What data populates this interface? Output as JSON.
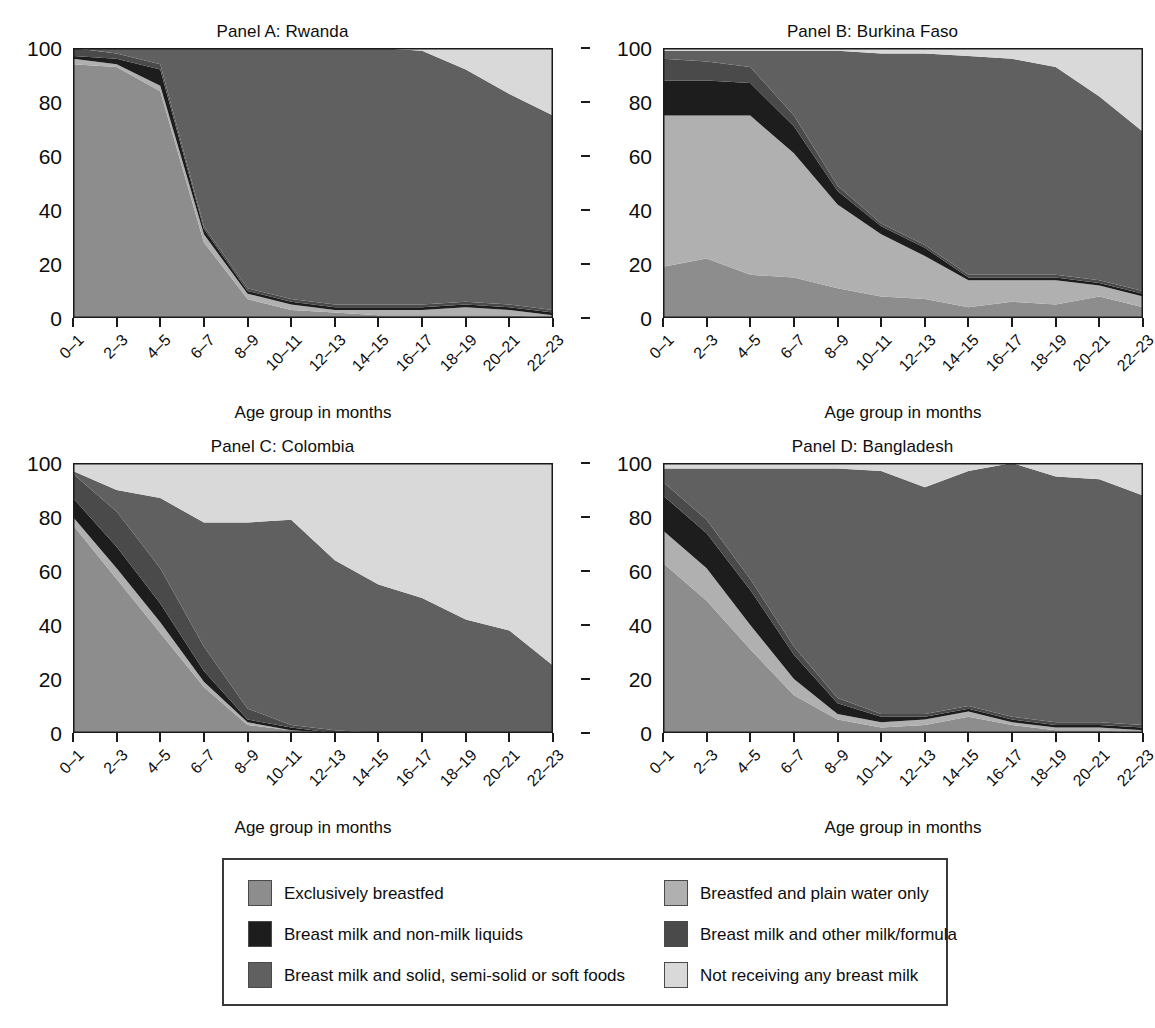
{
  "figure": {
    "xlabel": "Age group in months",
    "categories": [
      "0–1",
      "2–3",
      "4–5",
      "6–7",
      "8–9",
      "10–11",
      "12–13",
      "14–15",
      "16–17",
      "18–19",
      "20–21",
      "22–23"
    ],
    "yticks": [
      "0",
      "20",
      "40",
      "60",
      "80",
      "100"
    ],
    "ylim": [
      0,
      100
    ]
  },
  "colors": {
    "exclusively_breastfed": "#8d8d8d",
    "plain_water_only": "#b0b0b0",
    "non_milk_liquids": "#1d1d1d",
    "other_milk_formula": "#4a4a4a",
    "solid_foods": "#606060",
    "not_receiving": "#d9d9d9",
    "axis": "#1a1a1a",
    "legend_border": "#3a3a3a"
  },
  "legend": {
    "items": [
      {
        "key": "exclusively_breastfed",
        "label": "Exclusively breastfed",
        "color": "#8d8d8d",
        "col": 0,
        "row": 0
      },
      {
        "key": "plain_water_only",
        "label": "Breastfed and plain water only",
        "color": "#b0b0b0",
        "col": 1,
        "row": 0
      },
      {
        "key": "non_milk_liquids",
        "label": "Breast milk and non-milk liquids",
        "color": "#1d1d1d",
        "col": 0,
        "row": 1
      },
      {
        "key": "other_milk_formula",
        "label": "Breast milk and other milk/formula",
        "color": "#4a4a4a",
        "col": 1,
        "row": 1
      },
      {
        "key": "solid_foods",
        "label": "Breast milk and solid, semi-solid or soft foods",
        "color": "#606060",
        "col": 0,
        "row": 2
      },
      {
        "key": "not_receiving",
        "label": "Not receiving any breast milk",
        "color": "#d9d9d9",
        "col": 1,
        "row": 2
      }
    ]
  },
  "chart_data": [
    {
      "type": "area",
      "id": "panel-a",
      "title": "Panel A: Rwanda",
      "xlabel": "Age group in months",
      "ylabel": "",
      "ylim": [
        0,
        100
      ],
      "stacked": true,
      "grid": false,
      "legend_position": "bottom",
      "categories": [
        "0–1",
        "2–3",
        "4–5",
        "6–7",
        "8–9",
        "10–11",
        "12–13",
        "14–15",
        "16–17",
        "18–19",
        "20–21",
        "22–23"
      ],
      "series": [
        {
          "name": "Exclusively breastfed",
          "color": "#8d8d8d",
          "values": [
            94,
            93,
            84,
            28,
            7,
            3,
            2,
            1,
            1,
            1,
            1,
            0
          ]
        },
        {
          "name": "Breastfed and plain water only",
          "color": "#b0b0b0",
          "values": [
            2,
            1,
            2,
            3,
            2,
            2,
            1,
            2,
            2,
            3,
            2,
            1
          ]
        },
        {
          "name": "Breast milk and non-milk liquids",
          "color": "#1d1d1d",
          "values": [
            1,
            2,
            6,
            2,
            1,
            1,
            1,
            1,
            1,
            1,
            1,
            1
          ]
        },
        {
          "name": "Breast milk and other milk/formula",
          "color": "#4a4a4a",
          "values": [
            3,
            2,
            2,
            1,
            1,
            1,
            1,
            1,
            1,
            1,
            1,
            1
          ]
        },
        {
          "name": "Breast milk and solid, semi-solid or soft foods",
          "color": "#606060",
          "values": [
            0,
            2,
            6,
            66,
            89,
            93,
            95,
            95,
            94,
            86,
            78,
            72
          ]
        },
        {
          "name": "Not receiving any breast milk",
          "color": "#d9d9d9",
          "values": [
            0,
            0,
            0,
            0,
            0,
            0,
            0,
            0,
            1,
            8,
            17,
            25
          ]
        }
      ]
    },
    {
      "type": "area",
      "id": "panel-b",
      "title": "Panel B: Burkina Faso",
      "xlabel": "Age group in months",
      "ylabel": "",
      "ylim": [
        0,
        100
      ],
      "stacked": true,
      "grid": false,
      "legend_position": "bottom",
      "categories": [
        "0–1",
        "2–3",
        "4–5",
        "6–7",
        "8–9",
        "10–11",
        "12–13",
        "14–15",
        "16–17",
        "18–19",
        "20–21",
        "22–23"
      ],
      "series": [
        {
          "name": "Exclusively breastfed",
          "color": "#8d8d8d",
          "values": [
            19,
            22,
            16,
            15,
            11,
            8,
            7,
            4,
            6,
            5,
            8,
            4
          ]
        },
        {
          "name": "Breastfed and plain water only",
          "color": "#b0b0b0",
          "values": [
            56,
            53,
            59,
            46,
            31,
            23,
            16,
            10,
            8,
            9,
            4,
            4
          ]
        },
        {
          "name": "Breast milk and non-milk liquids",
          "color": "#1d1d1d",
          "values": [
            13,
            13,
            12,
            10,
            5,
            3,
            3,
            1,
            1,
            1,
            1,
            1
          ]
        },
        {
          "name": "Breast milk and other milk/formula",
          "color": "#4a4a4a",
          "values": [
            8,
            7,
            6,
            4,
            2,
            1,
            1,
            1,
            1,
            1,
            1,
            1
          ]
        },
        {
          "name": "Breast milk and solid, semi-solid or soft foods",
          "color": "#606060",
          "values": [
            3,
            4,
            6,
            24,
            50,
            63,
            71,
            81,
            80,
            77,
            68,
            59
          ]
        },
        {
          "name": "Not receiving any breast milk",
          "color": "#d9d9d9",
          "values": [
            1,
            1,
            1,
            1,
            1,
            2,
            2,
            3,
            4,
            7,
            18,
            31
          ]
        }
      ]
    },
    {
      "type": "area",
      "id": "panel-c",
      "title": "Panel C: Colombia",
      "xlabel": "Age group in months",
      "ylabel": "",
      "ylim": [
        0,
        100
      ],
      "stacked": true,
      "grid": false,
      "legend_position": "bottom",
      "categories": [
        "0–1",
        "2–3",
        "4–5",
        "6–7",
        "8–9",
        "10–11",
        "12–13",
        "14–15",
        "16–17",
        "18–19",
        "20–21",
        "22–23"
      ],
      "series": [
        {
          "name": "Exclusively breastfed",
          "color": "#8d8d8d",
          "values": [
            77,
            57,
            37,
            17,
            3,
            1,
            0,
            0,
            0,
            0,
            0,
            0
          ]
        },
        {
          "name": "Breastfed and plain water only",
          "color": "#b0b0b0",
          "values": [
            3,
            4,
            4,
            2,
            1,
            0,
            0,
            0,
            0,
            0,
            0,
            0
          ]
        },
        {
          "name": "Breast milk and non-milk liquids",
          "color": "#1d1d1d",
          "values": [
            7,
            8,
            7,
            4,
            1,
            1,
            0,
            0,
            0,
            0,
            0,
            0
          ]
        },
        {
          "name": "Breast milk and other milk/formula",
          "color": "#4a4a4a",
          "values": [
            9,
            13,
            13,
            9,
            4,
            1,
            1,
            0,
            0,
            0,
            0,
            0
          ]
        },
        {
          "name": "Breast milk and solid, semi-solid or soft foods",
          "color": "#606060",
          "values": [
            1,
            8,
            26,
            46,
            69,
            76,
            63,
            55,
            50,
            42,
            38,
            25
          ]
        },
        {
          "name": "Not receiving any breast milk",
          "color": "#d9d9d9",
          "values": [
            3,
            10,
            13,
            22,
            22,
            21,
            36,
            45,
            50,
            58,
            62,
            75
          ]
        }
      ]
    },
    {
      "type": "area",
      "id": "panel-d",
      "title": "Panel D: Bangladesh",
      "xlabel": "Age group in months",
      "ylabel": "",
      "ylim": [
        0,
        100
      ],
      "stacked": true,
      "grid": false,
      "legend_position": "bottom",
      "categories": [
        "0–1",
        "2–3",
        "4–5",
        "6–7",
        "8–9",
        "10–11",
        "12–13",
        "14–15",
        "16–17",
        "18–19",
        "20–21",
        "22–23"
      ],
      "series": [
        {
          "name": "Exclusively breastfed",
          "color": "#8d8d8d",
          "values": [
            63,
            49,
            31,
            14,
            5,
            2,
            3,
            6,
            3,
            1,
            1,
            0
          ]
        },
        {
          "name": "Breastfed and plain water only",
          "color": "#b0b0b0",
          "values": [
            12,
            12,
            9,
            6,
            2,
            2,
            2,
            2,
            1,
            1,
            1,
            1
          ]
        },
        {
          "name": "Breast milk and non-milk liquids",
          "color": "#1d1d1d",
          "values": [
            13,
            13,
            13,
            9,
            4,
            2,
            1,
            1,
            1,
            1,
            1,
            1
          ]
        },
        {
          "name": "Breast milk and other milk/formula",
          "color": "#4a4a4a",
          "values": [
            5,
            5,
            4,
            3,
            2,
            1,
            1,
            1,
            1,
            1,
            1,
            1
          ]
        },
        {
          "name": "Breast milk and solid, semi-solid or soft foods",
          "color": "#606060",
          "values": [
            5,
            19,
            41,
            66,
            85,
            90,
            84,
            87,
            94,
            91,
            90,
            85
          ]
        },
        {
          "name": "Not receiving any breast milk",
          "color": "#d9d9d9",
          "values": [
            2,
            2,
            2,
            2,
            2,
            3,
            9,
            3,
            0,
            5,
            6,
            12
          ]
        }
      ]
    }
  ]
}
